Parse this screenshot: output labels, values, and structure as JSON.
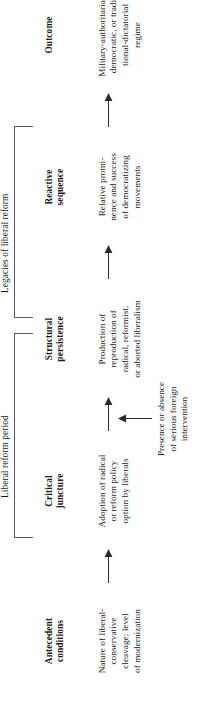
{
  "figure": {
    "orientation": "rotated-90-ccw",
    "groups": [
      {
        "id": "liberal-reform-period",
        "label": "Liberal reform period"
      },
      {
        "id": "legacies-of-liberal-reform",
        "label": "Legacies of liberal reform"
      }
    ],
    "stages": [
      {
        "id": "antecedent-conditions",
        "title": "Antecedent\nconditions",
        "title_lines": [
          "Antecedent",
          "conditions"
        ],
        "body": "Nature of liberal-\nconservative\ncleavage; level\nof modernization",
        "body_lines": [
          "Nature of liberal-",
          "conservative",
          "cleavage; level",
          "of modernization"
        ]
      },
      {
        "id": "critical-juncture",
        "title": "Critical\njuncture",
        "title_lines": [
          "Critical",
          "juncture"
        ],
        "body": "Adoption of radical\nor reform policy\noption by liberals",
        "body_lines": [
          "Adoption of radical",
          "or reform policy",
          "option by liberals"
        ]
      },
      {
        "id": "structural-persistence",
        "title": "Structural\npersistence",
        "title_lines": [
          "Structural",
          "persistence"
        ],
        "body": "Production of\nreproduction of\nradical, reformist,\nor aborted liberalism",
        "body_lines": [
          "Production of",
          "reproduction of",
          "radical, reformist,",
          "or aborted liberalism"
        ]
      },
      {
        "id": "reactive-sequence",
        "title": "Reactive\nsequence",
        "title_lines": [
          "Reactive",
          "sequence"
        ],
        "body": "Relative promi-\nnence and success\nof democratizing\nmovements",
        "body_lines": [
          "Relative promi-",
          "nence and success",
          "of democratizing",
          "movements"
        ]
      },
      {
        "id": "outcome",
        "title": "Outcome",
        "title_lines": [
          "Outcome"
        ],
        "body": "Military-authoritarian,\ndemocratic, or tradi-\ntional-dictatorial\nregime",
        "body_lines": [
          "Military-authoritarian,",
          "democratic, or tradi-",
          "tional-dictatorial",
          "regime"
        ]
      }
    ],
    "side_input": {
      "id": "foreign-intervention",
      "text": "Presence or absence\nof serious foreign\nintervention",
      "text_lines": [
        "Presence or absence",
        "of serious foreign",
        "intervention"
      ],
      "targets": "structural-persistence"
    },
    "arrows": [
      {
        "id": "arrow-antecedent-to-critical",
        "from": "antecedent-conditions",
        "to": "critical-juncture"
      },
      {
        "id": "arrow-critical-to-structural",
        "from": "critical-juncture",
        "to": "structural-persistence"
      },
      {
        "id": "arrow-structural-to-reactive",
        "from": "structural-persistence",
        "to": "reactive-sequence"
      },
      {
        "id": "arrow-reactive-to-outcome",
        "from": "reactive-sequence",
        "to": "outcome"
      },
      {
        "id": "arrow-foreign-intervention-in",
        "from": "foreign-intervention",
        "to": "structural-persistence"
      }
    ],
    "colors": {
      "ink": "#1a1a1a",
      "rule": "#5a5a5a",
      "background": "#ffffff"
    }
  }
}
